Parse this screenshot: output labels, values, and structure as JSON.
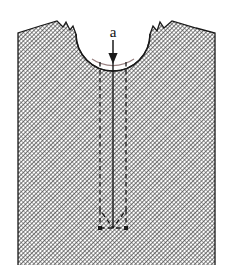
{
  "figure": {
    "type": "engineering-schematic",
    "canvas": {
      "width": 229,
      "height": 275,
      "background": "#ffffff"
    },
    "labels": {
      "crack_depth": "a"
    },
    "colors": {
      "hatch_line": "#3a3a3a",
      "hatch_fill": "#ffffff",
      "body_outline": "#1a1a1a",
      "crack_solid": "#1a1a1a",
      "crack_dashed": "#1a1a1a",
      "arrow": "#1a1a1a",
      "label": "#111111"
    },
    "geometry": {
      "body_left_x": 18,
      "body_right_x": 215,
      "body_bottom_y": 265,
      "top_left_corner": [
        57,
        21
      ],
      "top_right_corner": [
        172,
        21
      ],
      "notch_left_x": 77,
      "notch_right_x": 150,
      "notch_bottom_y": 62,
      "notch_radius": 37,
      "crack_center_x": 113,
      "crack_tip_y": 228,
      "crack_band_half_width": 13,
      "chevron_apex_y": 210,
      "hatch_spacing": 3,
      "hatch_angle_deg": 45
    },
    "annotations": {
      "arrow_label": "a",
      "arrow_start_y": 40,
      "arrow_end_y": 62,
      "arrow_x": 113,
      "label_x": 113,
      "label_y": 36
    }
  }
}
